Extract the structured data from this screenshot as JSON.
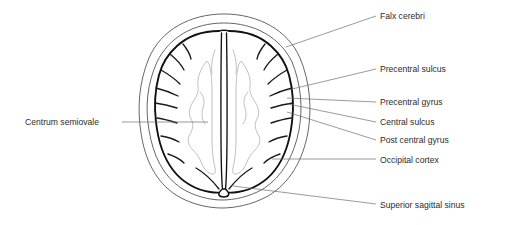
{
  "figure": {
    "background_color": "#ffffff",
    "line_color": "#111111",
    "leader_color": "#6e6e6e",
    "label_color": "#2b2b2b",
    "white_matter_color": "#b0b0b0"
  },
  "labels": [
    {
      "id": "falx-cerebri",
      "text": "Falx cerebri",
      "x": 380,
      "y": 19
    },
    {
      "id": "precentral-sulcus",
      "text": "Precentral sulcus",
      "x": 380,
      "y": 72
    },
    {
      "id": "precentral-gyrus",
      "text": "Precentral gyrus",
      "x": 380,
      "y": 105
    },
    {
      "id": "central-sulcus",
      "text": "Central sulcus",
      "x": 380,
      "y": 125
    },
    {
      "id": "post-central-gyrus",
      "text": "Post central gyrus",
      "x": 380,
      "y": 143
    },
    {
      "id": "occipital-cortex",
      "text": "Occipital cortex",
      "x": 380,
      "y": 163
    },
    {
      "id": "superior-sagittal-sinus",
      "text": "Superior sagittal sinus",
      "x": 380,
      "y": 208
    },
    {
      "id": "centrum-semiovale",
      "text": "Centrum semiovale",
      "x": 25,
      "y": 125
    }
  ]
}
